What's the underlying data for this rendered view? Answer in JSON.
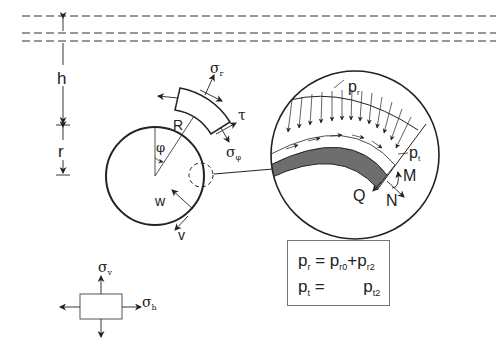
{
  "diagram": {
    "type": "tunnel lining load model",
    "labels": {
      "h": "h",
      "r": "r",
      "R": "R",
      "phi": "φ",
      "w": "w",
      "v": "v",
      "sigma_r": {
        "base": "σ",
        "sub": "r"
      },
      "tau": "τ",
      "sigma_phi": {
        "base": "σ",
        "sub": "φ"
      },
      "p_r": {
        "base": "p",
        "sub": "r"
      },
      "p_t": {
        "base": "p",
        "sub": "t"
      },
      "M": "M",
      "Q": "Q",
      "N": "N",
      "sigma_v": {
        "base": "σ",
        "sub": "v"
      },
      "sigma_h": {
        "base": "σ",
        "sub": "h"
      }
    },
    "formula": {
      "row1": {
        "lhs": "p",
        "lhs_sub": "r",
        "eq": " = ",
        "t1": "p",
        "t1_sub": "r0",
        "op": "+",
        "t2": "p",
        "t2_sub": "r2"
      },
      "row2": {
        "lhs": "p",
        "lhs_sub": "t",
        "eq": " = ",
        "t2": "p",
        "t2_sub": "t2"
      }
    },
    "colors": {
      "line": "#222222",
      "lining_fill": "#6e6e6e",
      "box_border": "#777777"
    }
  }
}
